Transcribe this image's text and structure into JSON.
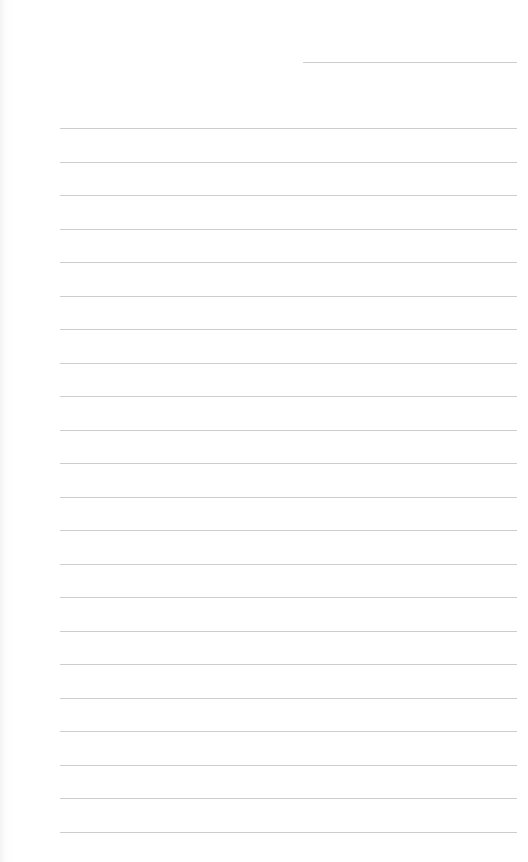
{
  "page": {
    "type": "blank lined writing sheet",
    "background_color": "#ffffff",
    "line_color": "#cdcdcd",
    "header_line": {
      "x": 303,
      "y": 62,
      "width": 214
    },
    "ruled_lines": {
      "count": 22,
      "x": 60,
      "width": 457,
      "first_y": 128,
      "spacing": 33.5
    }
  }
}
